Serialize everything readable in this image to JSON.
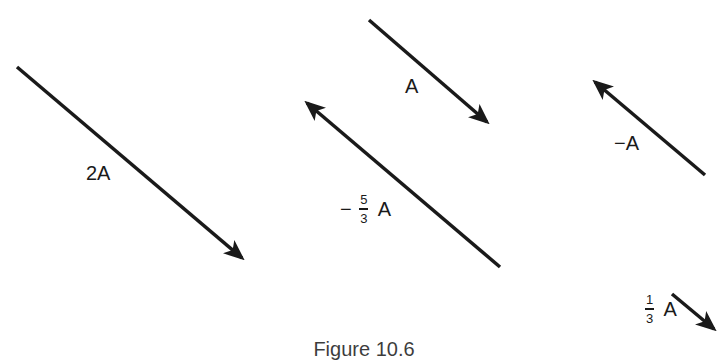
{
  "figure": {
    "caption": "Figure 10.6",
    "stroke_color": "#1a1a1a",
    "background": "#ffffff"
  },
  "vectors": [
    {
      "id": "v-2A",
      "label": "2A",
      "scalar": 2,
      "direction": "down-right",
      "from": [
        17,
        67
      ],
      "to": [
        242,
        258
      ],
      "label_pos": [
        86,
        163
      ]
    },
    {
      "id": "v-A",
      "label": "A",
      "scalar": 1,
      "direction": "down-right",
      "from": [
        369,
        20
      ],
      "to": [
        487,
        122
      ],
      "label_pos": [
        405,
        76
      ]
    },
    {
      "id": "v-neg-5-3A",
      "label_sign": "−",
      "label_num": "5",
      "label_den": "3",
      "label_var": "A",
      "scalar": -1.6667,
      "direction": "up-left",
      "from": [
        500,
        267
      ],
      "to": [
        307,
        103
      ],
      "label_pos": [
        340,
        196
      ]
    },
    {
      "id": "v-neg-A",
      "label": "−A",
      "scalar": -1,
      "direction": "up-left",
      "from": [
        705,
        175
      ],
      "to": [
        595,
        82
      ],
      "label_pos": [
        616,
        133
      ]
    },
    {
      "id": "v-1-3A",
      "label_num": "1",
      "label_den": "3",
      "label_var": "A",
      "scalar": 0.3333,
      "direction": "down-right",
      "from": [
        672,
        294
      ],
      "to": [
        714,
        329
      ],
      "label_pos": [
        645,
        296
      ]
    }
  ]
}
